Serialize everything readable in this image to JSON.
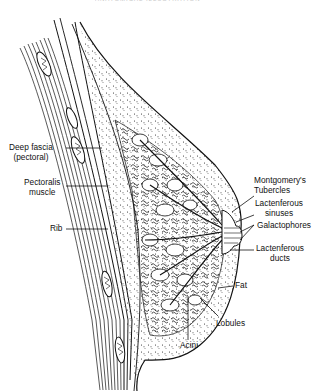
{
  "figure": {
    "header_fragment": "ANATOMICAL ILLUSTRATION"
  },
  "labels": {
    "deep_fascia": {
      "line1": "Deep fascia",
      "line2": "(pectoral)"
    },
    "pectoralis": {
      "line1": "Pectoralis",
      "line2": "muscle"
    },
    "rib": "Rib",
    "montgomery": {
      "line1": "Montgomery's",
      "line2": "Tubercles"
    },
    "lact_sinuses": {
      "line1": "Lactenferous",
      "line2": "sinuses"
    },
    "galactophores": "Galactophores",
    "lact_ducts": {
      "line1": "Lactenferous",
      "line2": "ducts"
    },
    "fat": "Fat",
    "lobules": "Lobules",
    "acini": "Acini"
  },
  "colors": {
    "ink": "#111111",
    "background": "#ffffff"
  }
}
